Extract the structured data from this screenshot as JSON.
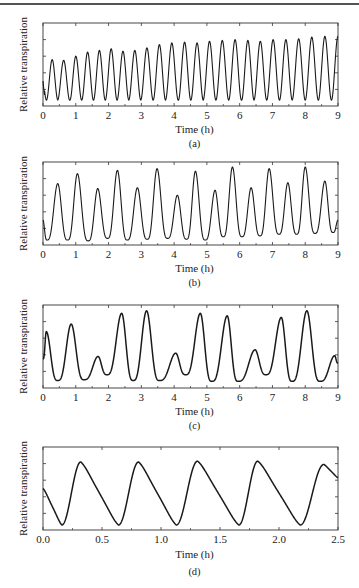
{
  "figure": {
    "ylabel": "Relative transpiration",
    "xlabel": "Time (h)"
  },
  "panels": [
    {
      "caption": "(a)",
      "xticks": [
        "0",
        "1",
        "2",
        "3",
        "4",
        "5",
        "6",
        "7",
        "8",
        "9"
      ]
    },
    {
      "caption": "(b)",
      "xticks": [
        "0",
        "1",
        "2",
        "3",
        "4",
        "5",
        "6",
        "7",
        "8",
        "9"
      ]
    },
    {
      "caption": "(c)",
      "xticks": [
        "0",
        "1",
        "2",
        "3",
        "4",
        "5",
        "6",
        "7",
        "8",
        "9"
      ]
    },
    {
      "caption": "(d)",
      "xticks": [
        "0.0",
        "0.5",
        "1.0",
        "1.5",
        "2.0",
        "2.5"
      ]
    }
  ],
  "chart_data": [
    {
      "type": "line",
      "title": "(a)",
      "xlabel": "Time (h)",
      "ylabel": "Relative transpiration",
      "xlim": [
        0,
        9
      ],
      "ylim": [
        0,
        1
      ],
      "yticks_labeled": false,
      "grid": false,
      "description": "Regular high-frequency oscillation, period ~0.37 h, amplitude slowly increasing",
      "period_h": 0.37,
      "peaks": {
        "x": [
          0.28,
          0.63,
          1.0,
          1.36,
          1.72,
          2.08,
          2.44,
          2.8,
          3.17,
          3.55,
          3.93,
          4.32,
          4.7,
          5.08,
          5.47,
          5.86,
          6.25,
          6.63,
          7.02,
          7.41,
          7.8,
          8.2,
          8.6
        ],
        "y": [
          0.56,
          0.55,
          0.6,
          0.65,
          0.67,
          0.69,
          0.66,
          0.67,
          0.7,
          0.74,
          0.76,
          0.77,
          0.76,
          0.78,
          0.79,
          0.8,
          0.79,
          0.78,
          0.8,
          0.8,
          0.81,
          0.83,
          0.84
        ]
      },
      "trough_level": 0.07
    },
    {
      "type": "line",
      "title": "(b)",
      "xlabel": "Time (h)",
      "ylabel": "Relative transpiration",
      "xlim": [
        0,
        9
      ],
      "ylim": [
        0,
        1
      ],
      "yticks_labeled": false,
      "grid": false,
      "description": "Oscillation, period ~0.58 h, alternating peak heights",
      "peaks": {
        "x": [
          0.45,
          1.05,
          1.67,
          2.27,
          2.88,
          3.48,
          4.1,
          4.65,
          5.25,
          5.78,
          6.35,
          6.9,
          7.47,
          8.0,
          8.6
        ],
        "y": [
          0.74,
          0.86,
          0.68,
          0.9,
          0.69,
          0.92,
          0.6,
          0.89,
          0.66,
          0.94,
          0.69,
          0.92,
          0.75,
          0.94,
          0.77
        ]
      },
      "troughs": {
        "x": [
          0.12,
          0.75,
          1.38,
          1.97,
          2.57,
          3.18,
          3.8,
          4.38,
          4.95,
          5.5,
          6.07,
          6.62,
          7.2,
          7.74,
          8.3,
          8.85
        ],
        "y": [
          0.06,
          0.06,
          0.05,
          0.08,
          0.06,
          0.07,
          0.08,
          0.07,
          0.06,
          0.1,
          0.1,
          0.11,
          0.13,
          0.13,
          0.14,
          0.15
        ]
      }
    },
    {
      "type": "line",
      "title": "(c)",
      "xlabel": "Time (h)",
      "ylabel": "Relative transpiration",
      "xlim": [
        0,
        9
      ],
      "ylim": [
        0,
        1
      ],
      "yticks_labeled": false,
      "grid": false,
      "description": "Irregular oscillation with period ~0.8 h, pattern of two tall peaks followed by a small peak",
      "peaks": {
        "x": [
          0.1,
          0.86,
          1.68,
          2.4,
          3.16,
          4.05,
          4.8,
          5.62,
          6.47,
          7.27,
          8.05,
          8.9
        ],
        "y": [
          0.68,
          0.77,
          0.38,
          0.9,
          0.93,
          0.42,
          0.9,
          0.87,
          0.46,
          0.85,
          0.93,
          0.39
        ]
      },
      "troughs": {
        "x": [
          0.45,
          1.25,
          1.95,
          2.75,
          3.55,
          4.35,
          5.15,
          5.95,
          6.8,
          7.6,
          8.45
        ],
        "y": [
          0.09,
          0.1,
          0.16,
          0.09,
          0.09,
          0.16,
          0.08,
          0.08,
          0.16,
          0.08,
          0.08
        ]
      }
    },
    {
      "type": "line",
      "title": "(d)",
      "xlabel": "Time (h)",
      "ylabel": "Relative transpiration",
      "xlim": [
        0,
        2.5
      ],
      "ylim": [
        0,
        1
      ],
      "yticks_labeled": false,
      "grid": false,
      "description": "Relaxation-type oscillation, period ~0.5 h: sharp rise, slow decline with shoulder",
      "peaks": {
        "x": [
          0.32,
          0.81,
          1.31,
          1.82,
          2.38
        ],
        "y": [
          0.82,
          0.82,
          0.83,
          0.83,
          0.79
        ]
      },
      "troughs": {
        "x": [
          0.16,
          0.64,
          1.13,
          1.66,
          2.18
        ],
        "y": [
          0.06,
          0.06,
          0.06,
          0.06,
          0.06
        ]
      },
      "start_value": 0.5,
      "end_value": 0.63
    }
  ]
}
